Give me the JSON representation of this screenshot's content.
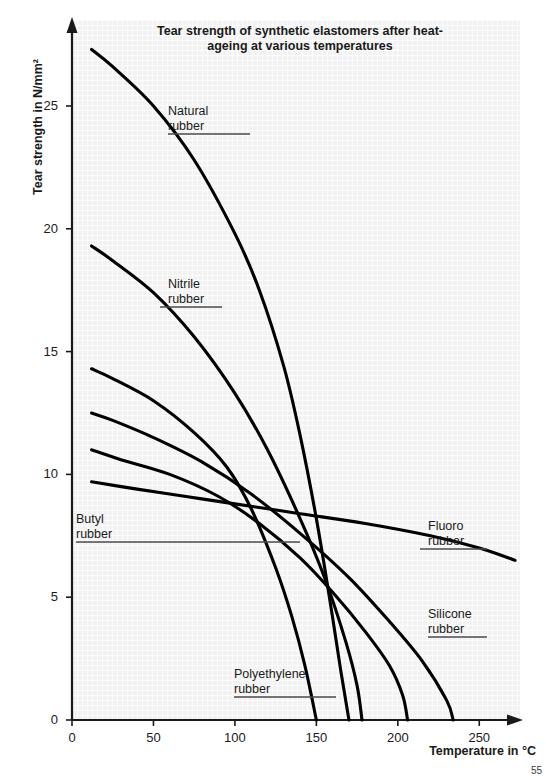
{
  "chart_data": {
    "type": "line",
    "title": "Tear strength of synthetic elastomers after heat-ageing at various temperatures",
    "title_line1": "Tear strength of synthetic elastomers",
    "title_line2": "after heat-ageing at various temperatures",
    "xlabel": "Temperature in °C",
    "ylabel": "Tear strength in N/mm²",
    "xlim": [
      0,
      275
    ],
    "ylim": [
      0,
      28.5
    ],
    "xticks": [
      0,
      50,
      100,
      150,
      200,
      250
    ],
    "xtick_labels": [
      "0",
      "50",
      "100",
      "150",
      "200",
      "250"
    ],
    "yticks": [
      0,
      5,
      10,
      15,
      20,
      25
    ],
    "ytick_labels": [
      "0",
      "5",
      "10",
      "15",
      "20",
      "25"
    ],
    "grid": true,
    "grid_style": "fine square mesh, light grey",
    "legend": "inline callout labels with underline leader lines",
    "line_color": "#000000",
    "series": [
      {
        "name": "Natural rubber",
        "label_line1": "Natural",
        "label_line2": "rubber",
        "points": [
          [
            12,
            27.3
          ],
          [
            25,
            26.6
          ],
          [
            50,
            25.0
          ],
          [
            75,
            22.8
          ],
          [
            100,
            19.8
          ],
          [
            115,
            17.5
          ],
          [
            130,
            14.4
          ],
          [
            140,
            11.6
          ],
          [
            150,
            8.2
          ],
          [
            158,
            5.0
          ],
          [
            165,
            2.0
          ],
          [
            170,
            0.0
          ]
        ]
      },
      {
        "name": "Nitrile rubber",
        "label_line1": "Nitrile",
        "label_line2": "rubber",
        "points": [
          [
            12,
            19.3
          ],
          [
            25,
            18.7
          ],
          [
            50,
            17.4
          ],
          [
            75,
            15.6
          ],
          [
            100,
            13.3
          ],
          [
            120,
            11.0
          ],
          [
            140,
            8.2
          ],
          [
            155,
            5.8
          ],
          [
            168,
            3.2
          ],
          [
            175,
            1.4
          ],
          [
            178,
            0.0
          ]
        ]
      },
      {
        "name": "Polyethylene rubber",
        "label_line1": "Polyethylene",
        "label_line2": "rubber",
        "points": [
          [
            12,
            14.3
          ],
          [
            25,
            13.9
          ],
          [
            50,
            13.0
          ],
          [
            75,
            11.7
          ],
          [
            95,
            10.3
          ],
          [
            110,
            8.6
          ],
          [
            125,
            6.2
          ],
          [
            135,
            4.2
          ],
          [
            143,
            2.2
          ],
          [
            150,
            0.0
          ]
        ]
      },
      {
        "name": "Silicone rubber",
        "label_line1": "Silicone",
        "label_line2": "rubber",
        "points": [
          [
            12,
            12.5
          ],
          [
            25,
            12.2
          ],
          [
            50,
            11.5
          ],
          [
            80,
            10.5
          ],
          [
            110,
            9.2
          ],
          [
            140,
            7.6
          ],
          [
            170,
            5.8
          ],
          [
            195,
            4.0
          ],
          [
            215,
            2.4
          ],
          [
            230,
            0.8
          ],
          [
            234,
            0.0
          ]
        ]
      },
      {
        "name": "Butyl rubber",
        "label_line1": "Butyl",
        "label_line2": "rubber",
        "points": [
          [
            12,
            11.0
          ],
          [
            30,
            10.6
          ],
          [
            60,
            10.0
          ],
          [
            90,
            9.1
          ],
          [
            115,
            8.0
          ],
          [
            140,
            6.6
          ],
          [
            160,
            5.2
          ],
          [
            180,
            3.6
          ],
          [
            195,
            2.2
          ],
          [
            203,
            1.0
          ],
          [
            206,
            0.0
          ]
        ]
      },
      {
        "name": "Fluoro rubber",
        "label_line1": "Fluoro",
        "label_line2": "rubber",
        "points": [
          [
            12,
            9.7
          ],
          [
            40,
            9.4
          ],
          [
            70,
            9.1
          ],
          [
            100,
            8.8
          ],
          [
            140,
            8.4
          ],
          [
            180,
            8.0
          ],
          [
            220,
            7.5
          ],
          [
            250,
            7.0
          ],
          [
            272,
            6.5
          ]
        ]
      }
    ]
  },
  "page": {
    "number": "55"
  }
}
